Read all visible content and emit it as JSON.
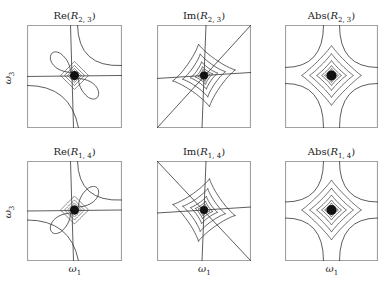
{
  "figure": {
    "panels": [
      {
        "id": "re-r23",
        "title_fn": "Re(",
        "title_var": "R",
        "title_sub": "2, 3",
        "title_close": ")",
        "row": 0,
        "col": 0,
        "ylabel": "ω",
        "ylabel_sub": "3",
        "xlabel": "",
        "xlabel_sub": "",
        "type": "real",
        "diagonal": "none"
      },
      {
        "id": "im-r23",
        "title_fn": "Im(",
        "title_var": "R",
        "title_sub": "2, 3",
        "title_close": ")",
        "row": 0,
        "col": 1,
        "ylabel": "",
        "ylabel_sub": "",
        "xlabel": "",
        "xlabel_sub": "",
        "type": "imag",
        "diagonal": "up"
      },
      {
        "id": "abs-r23",
        "title_fn": "Abs(",
        "title_var": "R",
        "title_sub": "2, 3",
        "title_close": ")",
        "row": 0,
        "col": 2,
        "ylabel": "",
        "ylabel_sub": "",
        "xlabel": "",
        "xlabel_sub": "",
        "type": "abs",
        "diagonal": "none"
      },
      {
        "id": "re-r14",
        "title_fn": "Re(",
        "title_var": "R",
        "title_sub": "1, 4",
        "title_close": ")",
        "row": 1,
        "col": 0,
        "ylabel": "ω",
        "ylabel_sub": "3",
        "xlabel": "ω",
        "xlabel_sub": "1",
        "type": "real-flip",
        "diagonal": "none"
      },
      {
        "id": "im-r14",
        "title_fn": "Im(",
        "title_var": "R",
        "title_sub": "1, 4",
        "title_close": ")",
        "row": 1,
        "col": 1,
        "ylabel": "",
        "ylabel_sub": "",
        "xlabel": "ω",
        "xlabel_sub": "1",
        "type": "imag-flip",
        "diagonal": "down"
      },
      {
        "id": "abs-r14",
        "title_fn": "Abs(",
        "title_var": "R",
        "title_sub": "1, 4",
        "title_close": ")",
        "row": 1,
        "col": 2,
        "ylabel": "",
        "ylabel_sub": "",
        "xlabel": "ω",
        "xlabel_sub": "1",
        "type": "abs",
        "diagonal": "none"
      }
    ],
    "colors": {
      "line": "#333333",
      "frame": "#444444",
      "background": "#ffffff"
    }
  }
}
